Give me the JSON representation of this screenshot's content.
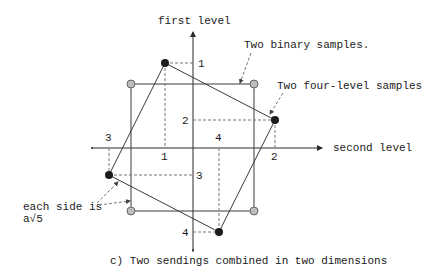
{
  "axes": {
    "vertical_label": "first level",
    "horizontal_label": "second level"
  },
  "annotations": {
    "binary": "Two binary samples.",
    "four_level": "Two four-level samples",
    "side_line1": "each side is",
    "side_line2": "a√5"
  },
  "ticks": {
    "first_axis": [
      "1",
      "2",
      "3",
      "4"
    ],
    "second_axis": [
      "1",
      "2",
      "3",
      "4"
    ]
  },
  "caption": "c) Two sendings combined in two dimensions",
  "colors": {
    "binary_point": "#bdbdbd",
    "four_level_point": "#1c1c1c",
    "lines": "#3a3a3a"
  },
  "points": {
    "binary": [
      {
        "x": 131,
        "y": 84
      },
      {
        "x": 254,
        "y": 84
      },
      {
        "x": 254,
        "y": 211
      },
      {
        "x": 131,
        "y": 211
      }
    ],
    "four_level": [
      {
        "x": 165,
        "y": 63,
        "label": "1"
      },
      {
        "x": 275,
        "y": 120,
        "label": "2"
      },
      {
        "x": 109,
        "y": 175,
        "label": "3"
      },
      {
        "x": 219,
        "y": 232,
        "label": "4"
      }
    ]
  }
}
